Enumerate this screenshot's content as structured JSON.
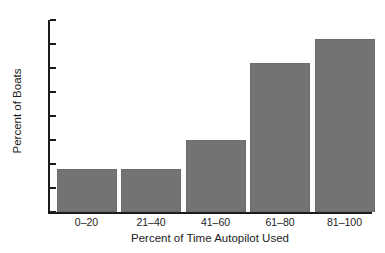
{
  "chart_data": {
    "type": "bar",
    "title": "",
    "categories": [
      "0–20",
      "21–40",
      "41–60",
      "61–80",
      "81–100"
    ],
    "values": [
      9,
      9,
      15,
      31,
      36
    ],
    "series": [
      {
        "name": "Percent of Boats",
        "values": [
          9,
          9,
          15,
          31,
          36
        ]
      }
    ],
    "xlabel": "Percent of Time Autopilot Used",
    "ylabel": "Percent of Boats",
    "ylim": [
      0,
      40
    ],
    "yticks": [
      0,
      5,
      10,
      15,
      20,
      25,
      30,
      35,
      40
    ],
    "ytick_labels": [
      "0",
      "5",
      "10",
      "15",
      "20",
      "25",
      "30",
      "35",
      "40"
    ],
    "grid": false,
    "legend": null,
    "bar_color": "#737373",
    "axis_color": "#1c1c1c",
    "background": "#ffffff"
  },
  "figure": {
    "title_remnant": "",
    "axis_label_x": "Percent of Time Autopilot Used",
    "axis_label_y": "Percent of Boats"
  }
}
